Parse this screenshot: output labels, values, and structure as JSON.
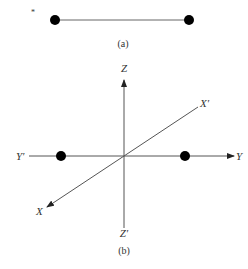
{
  "figure_a": {
    "caption": "(a)",
    "mark": "*",
    "dots": [
      {
        "x": 55,
        "y": 20
      },
      {
        "x": 189,
        "y": 20
      }
    ]
  },
  "figure_b": {
    "caption": "(b)",
    "axes": {
      "z_pos": "Z",
      "z_neg": "Z′",
      "y_pos": "Y",
      "y_neg": "Y′",
      "x_pos": "X",
      "x_neg": "X′"
    },
    "dots": [
      {
        "x": 61,
        "y": 156
      },
      {
        "x": 185,
        "y": 156
      }
    ]
  },
  "colors": {
    "line": "#555555",
    "dot": "#000000",
    "text": "#333333"
  }
}
